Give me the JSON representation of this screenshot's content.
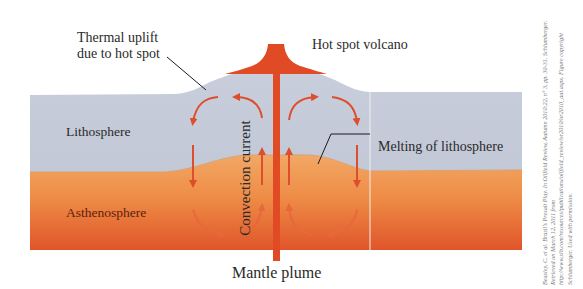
{
  "diagram": {
    "labels": {
      "thermal_uplift_line1": "Thermal uplift",
      "thermal_uplift_line2": "due to hot spot",
      "hot_spot_volcano": "Hot spot volcano",
      "lithosphere": "Lithosphere",
      "asthenosphere": "Asthenosphere",
      "melting_of_lithosphere": "Melting of lithosphere",
      "convection_current": "Convection current",
      "mantle_plume": "Mantle plume"
    },
    "credit": "Beasley, C. et al. Brazil's Presalt Play. In Oilfield Review, Autumn 2010:22, n° 3, pp. 30-31. Schlumberger. Retrieved on March 12, 2011 from http://www.slb.com/resources/publications/oilfield_review/or2010/or2010_aut.aspx. Figure copyright Schlumberger. Used with permission.",
    "colors": {
      "lithosphere": "#c5cbd8",
      "asthenosphere_top": "#f0a460",
      "asthenosphere_bottom": "#e0552a",
      "plume": "#e04a24",
      "arrows": "#dd4f2c",
      "text": "#2a2a2a",
      "leader_lines": "#1a1a1a"
    }
  }
}
